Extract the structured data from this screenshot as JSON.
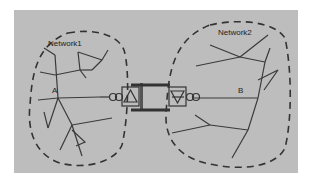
{
  "diagram": {
    "background_color": "#bdbdbd",
    "line_color": "#3a3a3a",
    "networks": [
      {
        "id": "network1",
        "label": "Network1",
        "node_label": "A"
      },
      {
        "id": "network2",
        "label": "Network2",
        "node_label": "B"
      }
    ],
    "bridge": {
      "left_symbol": "triangle-up",
      "right_symbol": "triangle-down",
      "coupling_symbol": "double-circle"
    }
  }
}
